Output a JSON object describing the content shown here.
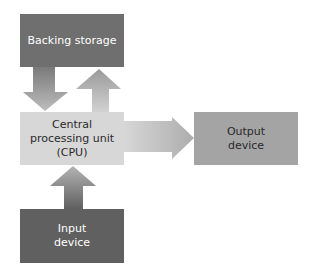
{
  "diagram": {
    "title": "",
    "nodes": {
      "backing_storage": {
        "label": "Backing storage",
        "color": "#6f6f6f"
      },
      "cpu": {
        "label": "Central\nprocessing unit\n(CPU)",
        "color": "#d7d7d7"
      },
      "output_device": {
        "label": "Output\ndevice",
        "color": "#a4a4a4"
      },
      "input_device": {
        "label": "Input\ndevice",
        "color": "#606060"
      }
    },
    "edges": [
      {
        "from": "backing_storage",
        "to": "cpu",
        "direction": "down"
      },
      {
        "from": "cpu",
        "to": "backing_storage",
        "direction": "up"
      },
      {
        "from": "cpu",
        "to": "output_device",
        "direction": "right"
      },
      {
        "from": "input_device",
        "to": "cpu",
        "direction": "up"
      }
    ]
  }
}
